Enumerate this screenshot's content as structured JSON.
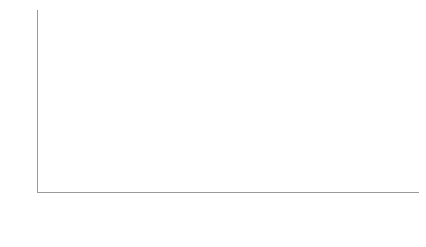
{
  "chart_data": {
    "type": "bar",
    "subtype": "stacked-column",
    "title": "",
    "xlabel": "",
    "ylabel": "",
    "ylim": [
      0,
      100
    ],
    "y_ticks": [
      0,
      10,
      20,
      30,
      40,
      50,
      60,
      70,
      80,
      90,
      100
    ],
    "grid": false,
    "legend_position": "bottom",
    "categories": [
      "2005",
      "2006",
      "2007",
      "2008",
      "2009",
      "2010",
      "2011",
      "2012",
      "2013",
      "2014"
    ],
    "series": [
      {
        "name": "3rd countries to EU (including Mb States)",
        "color": "#eeeeee",
        "values": [
          45,
          29,
          34,
          78,
          60,
          24,
          25,
          28,
          58,
          57
        ]
      },
      {
        "name": "STCs raised against EU measures",
        "color": "#a9a9a9",
        "values": [
          2,
          5,
          1,
          9,
          9,
          5,
          4,
          14,
          9,
          7
        ]
      }
    ],
    "totals": [
      47,
      34,
      35,
      87,
      69,
      29,
      29,
      42,
      67,
      64
    ]
  },
  "legend": {
    "items": [
      {
        "label": "3rd countries to EU (including Mb States)",
        "swatch": "base"
      },
      {
        "label": "STCs raised against EU measures",
        "swatch": "top"
      }
    ]
  },
  "colors": {
    "series_base": "#eeeeee",
    "series_top": "#a9a9a9",
    "axis": "#9a9a9a",
    "text": "#2b2b2b",
    "background": "#ffffff"
  }
}
